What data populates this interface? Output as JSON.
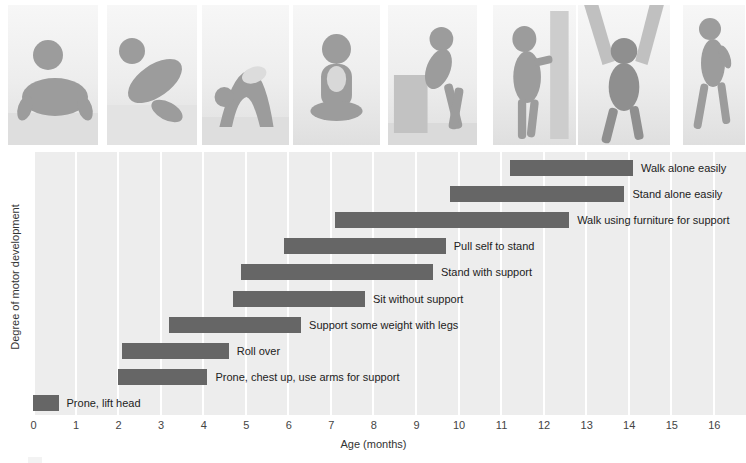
{
  "figure_kind": "textbook motor-development milestone chart with baby photos",
  "photos": [
    {
      "depicts": "baby lying prone lifting head"
    },
    {
      "depicts": "baby rolling over"
    },
    {
      "depicts": "baby on hands and feet, bottom up"
    },
    {
      "depicts": "baby sitting without support"
    },
    {
      "depicts": "baby pulling self to stand on box"
    },
    {
      "depicts": "baby standing holding furniture"
    },
    {
      "depicts": "baby walking supported by adult hands"
    },
    {
      "depicts": "baby walking alone"
    }
  ],
  "chart_data": {
    "type": "bar",
    "orientation": "horizontal-range",
    "title": "",
    "xlabel": "Age (months)",
    "ylabel": "Degree of motor development",
    "xlim": [
      0,
      16
    ],
    "xticks": [
      0,
      1,
      2,
      3,
      4,
      5,
      6,
      7,
      8,
      9,
      10,
      11,
      12,
      13,
      14,
      15,
      16
    ],
    "grid": "vertical white gridlines at each month",
    "bar_color": "#666666",
    "plot_bg": "#ededed",
    "gridline_color": "#ffffff",
    "milestones": [
      {
        "label": "Walk alone easily",
        "start_month": 11.2,
        "end_month": 14.1
      },
      {
        "label": "Stand alone easily",
        "start_month": 9.8,
        "end_month": 13.9
      },
      {
        "label": "Walk using furniture for support",
        "start_month": 7.1,
        "end_month": 12.6
      },
      {
        "label": "Pull self to stand",
        "start_month": 5.9,
        "end_month": 9.7
      },
      {
        "label": "Stand with support",
        "start_month": 4.9,
        "end_month": 9.4
      },
      {
        "label": "Sit without support",
        "start_month": 4.7,
        "end_month": 7.8
      },
      {
        "label": "Support some weight with legs",
        "start_month": 3.2,
        "end_month": 6.3
      },
      {
        "label": "Roll over",
        "start_month": 2.1,
        "end_month": 4.6
      },
      {
        "label": "Prone, chest up, use arms for support",
        "start_month": 2.0,
        "end_month": 4.1
      },
      {
        "label": "Prone, lift head",
        "start_month": 0.0,
        "end_month": 0.6
      }
    ]
  }
}
